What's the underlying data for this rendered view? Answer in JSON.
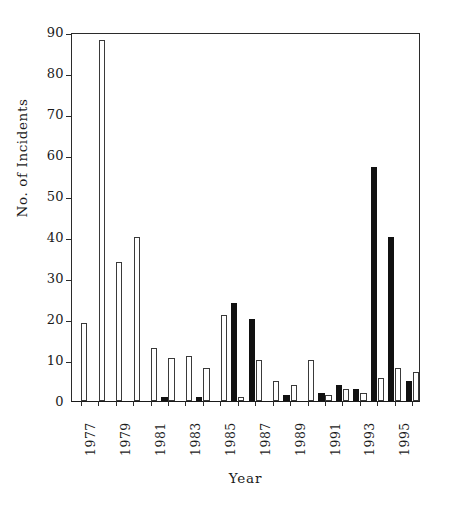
{
  "chart_data": {
    "type": "bar",
    "title": "",
    "xlabel": "Year",
    "ylabel": "No. of Incidents",
    "ylim": [
      0,
      90
    ],
    "ytick_values": [
      0,
      10,
      20,
      30,
      40,
      50,
      60,
      70,
      80,
      90
    ],
    "ytick_labels": [
      "0",
      "10",
      "20",
      "30",
      "40",
      "50",
      "60",
      "70",
      "80",
      "90"
    ],
    "grid": false,
    "legend": "none",
    "categories": [
      1977,
      1978,
      1979,
      1980,
      1981,
      1982,
      1983,
      1984,
      1985,
      1986,
      1987,
      1988,
      1989,
      1990,
      1991,
      1992,
      1993,
      1994,
      1995,
      1996
    ],
    "xtick_labels": [
      "1977",
      "1979",
      "1981",
      "1983",
      "1985",
      "1987",
      "1989",
      "1991",
      "1993",
      "1995"
    ],
    "xtick_categories": [
      1977,
      1979,
      1981,
      1983,
      1985,
      1987,
      1989,
      1991,
      1993,
      1995
    ],
    "series": [
      {
        "name": "open-bars",
        "style": "open",
        "values": [
          19,
          88,
          34,
          40,
          13,
          10.5,
          11,
          8,
          21,
          1,
          10,
          5,
          4,
          10,
          1.5,
          3,
          2,
          5.5,
          8,
          7
        ]
      },
      {
        "name": "filled-bars",
        "style": "filled",
        "values": [
          0,
          0,
          0,
          0,
          0,
          1,
          0,
          1,
          0,
          24,
          20,
          0,
          1.5,
          0,
          2,
          4,
          3,
          57,
          40,
          5
        ]
      }
    ]
  },
  "colors": {
    "open_fill": "#ffffff",
    "open_stroke": "#3a3a3a",
    "filled": "#111111",
    "axis": "#2b2b2b",
    "background": "#ffffff"
  }
}
